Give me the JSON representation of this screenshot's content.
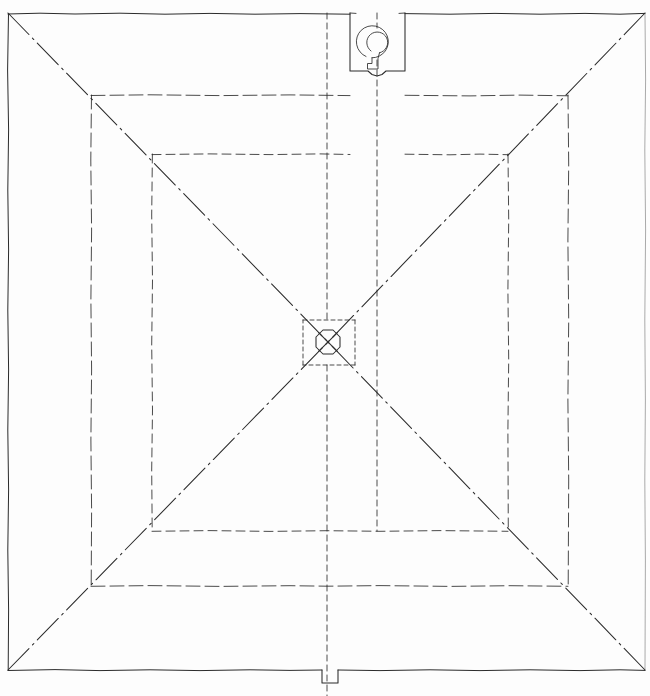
{
  "document": {
    "type": "architectural-drawing",
    "title": "Roof Plan",
    "medium": "hand-drawn ink on paper",
    "background_color": "#fdfdfd",
    "ink_color": "#2b2b2b",
    "width_px": 650,
    "height_px": 696
  },
  "drawing": {
    "description": "Symmetrical square roof plan with four nested rectangular outlines, diagonal hip/valley chain-dot lines running corner to corner, a central square ceiling fixture containing an octagon with crossed diagonals, a chimney or roof-light box at the top edge containing a spiral scroll symbol, and a small notch in the bottom edge.",
    "outer_boundary": {
      "name": "outer-wall-outline",
      "left": 8,
      "top": 13,
      "right": 645,
      "bottom": 670,
      "line_style": "sketchy solid, right edge faint"
    },
    "ring_2": {
      "name": "eaves-outline",
      "left": 91,
      "top": 95,
      "right": 568,
      "bottom": 586,
      "line_style": "long dash"
    },
    "ring_3": {
      "name": "roof-slope-outline",
      "left": 152,
      "top": 154,
      "right": 508,
      "bottom": 531,
      "line_style": "medium dash"
    },
    "center_fixture": {
      "name": "ceiling-rose",
      "square": {
        "left": 303,
        "top": 320,
        "right": 355,
        "bottom": 365
      },
      "octagon": {
        "cx": 328,
        "cy": 342,
        "r": 12
      },
      "has_cross": true,
      "line_style": "short dash square, solid octagon"
    },
    "top_box": {
      "name": "chimney-box",
      "left": 350,
      "top": 13,
      "right": 405,
      "bottom": 72,
      "symbol": "spiral-scroll",
      "spiral": {
        "cx": 377,
        "cy": 44,
        "r": 16
      }
    },
    "bottom_notch": {
      "name": "bottom-notch",
      "left": 322,
      "right": 338,
      "top": 670,
      "bottom": 683
    },
    "centerlines": [
      {
        "name": "vertical-centerline",
        "x": 327,
        "y1": 13,
        "y2": 696,
        "style": "dash"
      },
      {
        "name": "vertical-offset-line",
        "x": 377,
        "y1": 13,
        "y2": 531,
        "style": "dash"
      }
    ],
    "diagonals": [
      {
        "name": "hip-line-top-left",
        "x1": 8,
        "y1": 13,
        "x2": 328,
        "y2": 342
      },
      {
        "name": "hip-line-top-right",
        "x1": 645,
        "y1": 13,
        "x2": 328,
        "y2": 342
      },
      {
        "name": "hip-line-bottom-left",
        "x1": 8,
        "y1": 670,
        "x2": 328,
        "y2": 342
      },
      {
        "name": "hip-line-bottom-right",
        "x1": 645,
        "y1": 670,
        "x2": 328,
        "y2": 342
      }
    ]
  },
  "labels": {
    "none_visible": "",
    "caption": ""
  }
}
